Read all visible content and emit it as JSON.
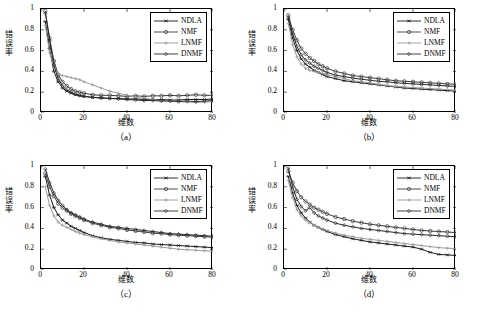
{
  "figure": {
    "panels": [
      {
        "caption": "（a）",
        "xlabel": "维数",
        "ylabel": "错误率",
        "legend": [
          "NDLA",
          "NMF",
          "LNMF",
          "DNMF"
        ],
        "chart_data": {
          "type": "line",
          "title": "",
          "xlabel": "维数",
          "ylabel": "错误率",
          "xlim": [
            0,
            80
          ],
          "ylim": [
            0,
            1
          ],
          "xticks": [
            0,
            20,
            40,
            60,
            80
          ],
          "yticks": [
            0,
            0.2,
            0.4,
            0.6,
            0.8,
            1
          ],
          "grid": false,
          "legend_position": "top-right",
          "x": [
            2,
            4,
            6,
            8,
            10,
            12,
            14,
            16,
            18,
            20,
            24,
            28,
            32,
            36,
            40,
            44,
            48,
            52,
            56,
            60,
            64,
            68,
            72,
            76,
            80
          ],
          "series": [
            {
              "name": "NDLA",
              "values": [
                0.88,
                0.62,
                0.4,
                0.3,
                0.24,
                0.21,
                0.19,
                0.175,
                0.165,
                0.16,
                0.15,
                0.145,
                0.14,
                0.14,
                0.135,
                0.135,
                0.13,
                0.13,
                0.13,
                0.125,
                0.125,
                0.13,
                0.13,
                0.13,
                0.135
              ]
            },
            {
              "name": "NMF",
              "values": [
                0.98,
                0.72,
                0.5,
                0.37,
                0.3,
                0.26,
                0.23,
                0.21,
                0.2,
                0.19,
                0.175,
                0.17,
                0.17,
                0.165,
                0.16,
                0.165,
                0.16,
                0.165,
                0.165,
                0.17,
                0.165,
                0.17,
                0.175,
                0.17,
                0.17
              ]
            },
            {
              "name": "LNMF",
              "values": [
                0.84,
                0.58,
                0.44,
                0.38,
                0.36,
                0.35,
                0.34,
                0.33,
                0.32,
                0.3,
                0.27,
                0.24,
                0.21,
                0.19,
                0.17,
                0.15,
                0.14,
                0.13,
                0.12,
                0.115,
                0.11,
                0.105,
                0.1,
                0.105,
                0.11
              ]
            },
            {
              "name": "DNMF",
              "values": [
                0.96,
                0.7,
                0.46,
                0.33,
                0.26,
                0.22,
                0.2,
                0.18,
                0.17,
                0.16,
                0.15,
                0.145,
                0.14,
                0.135,
                0.13,
                0.125,
                0.12,
                0.12,
                0.115,
                0.115,
                0.11,
                0.115,
                0.11,
                0.115,
                0.12
              ]
            }
          ]
        }
      },
      {
        "caption": "（b）",
        "xlabel": "维数",
        "ylabel": "错误率",
        "legend": [
          "NDLA",
          "NMF",
          "LNMF",
          "DNMF"
        ],
        "chart_data": {
          "type": "line",
          "title": "",
          "xlabel": "维数",
          "ylabel": "错误率",
          "xlim": [
            0,
            80
          ],
          "ylim": [
            0,
            1
          ],
          "xticks": [
            0,
            20,
            40,
            60,
            80
          ],
          "yticks": [
            0,
            0.2,
            0.4,
            0.6,
            0.8,
            1
          ],
          "grid": false,
          "legend_position": "top-right",
          "x": [
            2,
            4,
            6,
            8,
            10,
            12,
            14,
            16,
            18,
            20,
            24,
            28,
            32,
            36,
            40,
            44,
            48,
            52,
            56,
            60,
            64,
            68,
            72,
            76,
            80
          ],
          "series": [
            {
              "name": "NDLA",
              "values": [
                0.9,
                0.72,
                0.6,
                0.52,
                0.47,
                0.44,
                0.41,
                0.39,
                0.37,
                0.35,
                0.33,
                0.31,
                0.3,
                0.29,
                0.28,
                0.27,
                0.26,
                0.25,
                0.24,
                0.235,
                0.23,
                0.225,
                0.22,
                0.215,
                0.21
              ]
            },
            {
              "name": "NMF",
              "values": [
                0.94,
                0.8,
                0.7,
                0.62,
                0.57,
                0.53,
                0.5,
                0.47,
                0.45,
                0.43,
                0.4,
                0.38,
                0.36,
                0.35,
                0.34,
                0.33,
                0.32,
                0.31,
                0.305,
                0.3,
                0.295,
                0.29,
                0.285,
                0.28,
                0.275
              ]
            },
            {
              "name": "LNMF",
              "values": [
                0.86,
                0.66,
                0.54,
                0.47,
                0.43,
                0.41,
                0.4,
                0.39,
                0.38,
                0.37,
                0.35,
                0.33,
                0.31,
                0.3,
                0.29,
                0.275,
                0.265,
                0.255,
                0.25,
                0.245,
                0.24,
                0.235,
                0.23,
                0.225,
                0.22
              ]
            },
            {
              "name": "DNMF",
              "values": [
                0.92,
                0.76,
                0.64,
                0.56,
                0.51,
                0.48,
                0.45,
                0.43,
                0.41,
                0.39,
                0.365,
                0.35,
                0.335,
                0.325,
                0.315,
                0.305,
                0.3,
                0.29,
                0.285,
                0.28,
                0.275,
                0.27,
                0.265,
                0.26,
                0.255
              ]
            }
          ]
        }
      },
      {
        "caption": "（c）",
        "xlabel": "维数",
        "ylabel": "错误率",
        "legend": [
          "NDLA",
          "NMF",
          "LNMF",
          "DNMF"
        ],
        "chart_data": {
          "type": "line",
          "title": "",
          "xlabel": "维数",
          "ylabel": "错误率",
          "xlim": [
            0,
            80
          ],
          "ylim": [
            0,
            1
          ],
          "xticks": [
            0,
            20,
            40,
            60,
            80
          ],
          "yticks": [
            0,
            0.2,
            0.4,
            0.6,
            0.8,
            1
          ],
          "grid": false,
          "legend_position": "top-right",
          "x": [
            2,
            4,
            6,
            8,
            10,
            12,
            14,
            16,
            18,
            20,
            24,
            28,
            32,
            36,
            40,
            44,
            48,
            52,
            56,
            60,
            64,
            68,
            72,
            76,
            80
          ],
          "series": [
            {
              "name": "NDLA",
              "values": [
                0.9,
                0.72,
                0.6,
                0.53,
                0.48,
                0.45,
                0.42,
                0.4,
                0.38,
                0.36,
                0.33,
                0.31,
                0.295,
                0.285,
                0.275,
                0.265,
                0.26,
                0.25,
                0.245,
                0.24,
                0.235,
                0.23,
                0.225,
                0.22,
                0.215
              ]
            },
            {
              "name": "NMF",
              "values": [
                0.93,
                0.8,
                0.71,
                0.64,
                0.6,
                0.57,
                0.54,
                0.52,
                0.5,
                0.48,
                0.45,
                0.43,
                0.41,
                0.4,
                0.385,
                0.375,
                0.365,
                0.355,
                0.35,
                0.34,
                0.335,
                0.33,
                0.325,
                0.32,
                0.315
              ]
            },
            {
              "name": "LNMF",
              "values": [
                0.8,
                0.62,
                0.52,
                0.46,
                0.43,
                0.41,
                0.39,
                0.37,
                0.355,
                0.34,
                0.32,
                0.3,
                0.285,
                0.27,
                0.26,
                0.25,
                0.24,
                0.23,
                0.22,
                0.21,
                0.2,
                0.195,
                0.19,
                0.185,
                0.18
              ]
            },
            {
              "name": "DNMF",
              "values": [
                0.97,
                0.84,
                0.74,
                0.67,
                0.62,
                0.58,
                0.55,
                0.53,
                0.51,
                0.49,
                0.46,
                0.44,
                0.42,
                0.41,
                0.4,
                0.39,
                0.38,
                0.37,
                0.36,
                0.35,
                0.345,
                0.34,
                0.335,
                0.33,
                0.325
              ]
            }
          ]
        }
      },
      {
        "caption": "（d）",
        "xlabel": "维数",
        "ylabel": "错误率",
        "legend": [
          "NDLA",
          "NMF",
          "LNMF",
          "DNMF"
        ],
        "chart_data": {
          "type": "line",
          "title": "",
          "xlabel": "维数",
          "ylabel": "错误率",
          "xlim": [
            0,
            80
          ],
          "ylim": [
            0,
            1
          ],
          "xticks": [
            0,
            20,
            40,
            60,
            80
          ],
          "yticks": [
            0,
            0.2,
            0.4,
            0.6,
            0.8,
            1
          ],
          "grid": false,
          "legend_position": "top-right",
          "x": [
            2,
            4,
            6,
            8,
            10,
            12,
            14,
            16,
            18,
            20,
            24,
            28,
            32,
            36,
            40,
            44,
            48,
            52,
            56,
            60,
            64,
            68,
            72,
            76,
            80
          ],
          "series": [
            {
              "name": "NDLA",
              "values": [
                0.9,
                0.74,
                0.62,
                0.55,
                0.5,
                0.46,
                0.43,
                0.41,
                0.39,
                0.37,
                0.34,
                0.32,
                0.3,
                0.285,
                0.27,
                0.26,
                0.25,
                0.24,
                0.23,
                0.22,
                0.2,
                0.17,
                0.15,
                0.145,
                0.14
              ]
            },
            {
              "name": "NMF",
              "values": [
                0.95,
                0.84,
                0.76,
                0.7,
                0.66,
                0.63,
                0.6,
                0.58,
                0.56,
                0.54,
                0.51,
                0.49,
                0.47,
                0.455,
                0.44,
                0.43,
                0.42,
                0.41,
                0.4,
                0.39,
                0.38,
                0.375,
                0.37,
                0.365,
                0.36
              ]
            },
            {
              "name": "LNMF",
              "values": [
                0.86,
                0.7,
                0.58,
                0.52,
                0.48,
                0.455,
                0.43,
                0.41,
                0.395,
                0.38,
                0.355,
                0.335,
                0.32,
                0.305,
                0.295,
                0.285,
                0.275,
                0.265,
                0.255,
                0.245,
                0.235,
                0.225,
                0.215,
                0.21,
                0.205
              ]
            },
            {
              "name": "DNMF",
              "values": [
                0.98,
                0.8,
                0.68,
                0.61,
                0.57,
                0.6,
                0.55,
                0.52,
                0.5,
                0.48,
                0.45,
                0.43,
                0.415,
                0.4,
                0.39,
                0.38,
                0.37,
                0.36,
                0.35,
                0.345,
                0.34,
                0.335,
                0.33,
                0.325,
                0.32
              ]
            }
          ]
        }
      }
    ]
  }
}
